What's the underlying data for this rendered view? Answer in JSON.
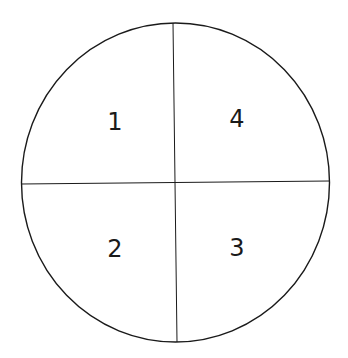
{
  "diagram": {
    "title": "",
    "shape": "circle divided into four quadrants",
    "colors": {
      "stroke": "#1a1a1a",
      "background": "#ffffff",
      "text": "#1a1a1a"
    },
    "quadrants": [
      {
        "position": "top-left",
        "label": "1"
      },
      {
        "position": "bottom-left",
        "label": "2"
      },
      {
        "position": "bottom-right",
        "label": "3"
      },
      {
        "position": "top-right",
        "label": "4"
      }
    ]
  }
}
